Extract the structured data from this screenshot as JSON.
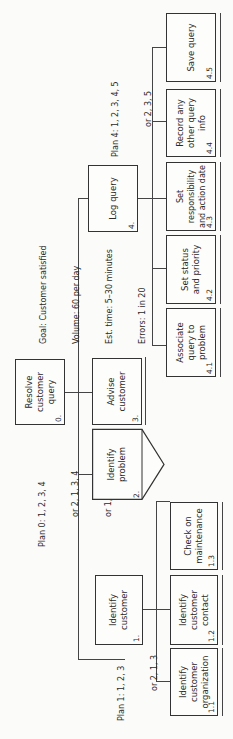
{
  "goal_block": {
    "lines": [
      "Goal: Customer satisfied",
      "Volume: 60 per day",
      "Est. time: 5–30 minutes",
      "Errors: 1 in 20"
    ]
  },
  "plans": {
    "plan0": [
      "Plan 0: 1, 2, 3, 4",
      "or 2, 1, 3, 4",
      "or 1, 2, 4"
    ],
    "plan1": [
      "Plan 1: 1, 2, 3",
      "or 2, 1, 3"
    ],
    "plan4": [
      "Plan 4: 1, 2, 3, 4, 5",
      "or 2, 3, 5"
    ]
  },
  "tasks": {
    "t0": {
      "num": "0.",
      "label": "Resolve customer query"
    },
    "t1": {
      "num": "1.",
      "label": "Identify customer"
    },
    "t2": {
      "num": "2.",
      "label": "Identify problem"
    },
    "t3": {
      "num": "3.",
      "label": "Advise customer"
    },
    "t4": {
      "num": "4.",
      "label": "Log query"
    },
    "t1_1": {
      "num": "1.1",
      "label": "Identify customer organization"
    },
    "t1_2": {
      "num": "1.2",
      "label": "Identify customer contact"
    },
    "t1_3": {
      "num": "1.3",
      "label": "Check on maintenance"
    },
    "t4_1": {
      "num": "4.1",
      "label": "Associate query to problem"
    },
    "t4_2": {
      "num": "4.2",
      "label": "Set status and priority"
    },
    "t4_3": {
      "num": "4.3",
      "label": "Set responsibility and action date"
    },
    "t4_4": {
      "num": "4.4",
      "label": "Record any other query info"
    },
    "t4_5": {
      "num": "4.5",
      "label": "Save query"
    }
  }
}
